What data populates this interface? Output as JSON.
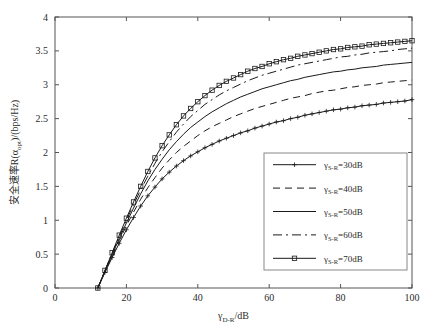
{
  "chart_data": {
    "type": "line",
    "title": "",
    "xlabel": "γD-R/dB",
    "xlabel_main": "γ",
    "xlabel_sub": "D-R",
    "xlabel_unit": "/dB",
    "ylabel": "安全速率R(αopt)/(bps/Hz)",
    "ylabel_part1": "安全速率R(α",
    "ylabel_sub": "opt",
    "ylabel_part2": ")/(bps/Hz)",
    "xlim": [
      0,
      100
    ],
    "ylim": [
      0,
      4
    ],
    "xticks": [
      "0",
      "20",
      "40",
      "60",
      "80",
      "100"
    ],
    "xtick_values": [
      0,
      20,
      40,
      60,
      80,
      100
    ],
    "yticks": [
      "0",
      "0.5",
      "1",
      "1.5",
      "2",
      "2.5",
      "3",
      "3.5",
      "4"
    ],
    "ytick_values": [
      0,
      0.5,
      1,
      1.5,
      2,
      2.5,
      3,
      3.5,
      4
    ],
    "grid": false,
    "legend_position": "lower right",
    "x": [
      12,
      14,
      16,
      18,
      20,
      22,
      24,
      26,
      28,
      30,
      32,
      34,
      36,
      38,
      40,
      42,
      44,
      46,
      48,
      50,
      52,
      54,
      56,
      58,
      60,
      62,
      64,
      66,
      68,
      70,
      72,
      74,
      76,
      78,
      80,
      82,
      84,
      86,
      88,
      90,
      92,
      94,
      96,
      98,
      100
    ],
    "series": [
      {
        "name": "γS-R=30dB",
        "label_main": "γ",
        "label_sub": "S-R",
        "label_rest": "=30dB",
        "style": "solid-plus",
        "marker": "plus",
        "values": [
          0,
          0.23,
          0.45,
          0.66,
          0.86,
          1.04,
          1.21,
          1.36,
          1.49,
          1.61,
          1.71,
          1.8,
          1.88,
          1.95,
          2.01,
          2.07,
          2.12,
          2.17,
          2.21,
          2.25,
          2.29,
          2.32,
          2.36,
          2.39,
          2.42,
          2.45,
          2.47,
          2.5,
          2.52,
          2.55,
          2.57,
          2.59,
          2.61,
          2.63,
          2.64,
          2.66,
          2.67,
          2.69,
          2.7,
          2.71,
          2.73,
          2.74,
          2.75,
          2.76,
          2.78
        ]
      },
      {
        "name": "γS-R=40dB",
        "label_main": "γ",
        "label_sub": "S-R",
        "label_rest": "=40dB",
        "style": "dashed",
        "marker": "none",
        "values": [
          0,
          0.24,
          0.47,
          0.7,
          0.92,
          1.12,
          1.31,
          1.48,
          1.63,
          1.77,
          1.89,
          2.0,
          2.09,
          2.17,
          2.25,
          2.32,
          2.38,
          2.43,
          2.48,
          2.53,
          2.57,
          2.61,
          2.65,
          2.68,
          2.71,
          2.74,
          2.77,
          2.8,
          2.82,
          2.84,
          2.87,
          2.89,
          2.91,
          2.92,
          2.94,
          2.96,
          2.97,
          2.99,
          3.0,
          3.01,
          3.03,
          3.04,
          3.05,
          3.06,
          3.07
        ]
      },
      {
        "name": "γS-R=50dB",
        "label_main": "γ",
        "label_sub": "S-R",
        "label_rest": "=50dB",
        "style": "solid",
        "marker": "none",
        "values": [
          0,
          0.25,
          0.49,
          0.73,
          0.96,
          1.18,
          1.39,
          1.58,
          1.75,
          1.9,
          2.04,
          2.16,
          2.27,
          2.37,
          2.45,
          2.53,
          2.6,
          2.66,
          2.72,
          2.77,
          2.82,
          2.86,
          2.9,
          2.94,
          2.97,
          3.0,
          3.03,
          3.06,
          3.08,
          3.11,
          3.13,
          3.15,
          3.17,
          3.19,
          3.2,
          3.22,
          3.23,
          3.25,
          3.26,
          3.27,
          3.29,
          3.3,
          3.31,
          3.32,
          3.33
        ]
      },
      {
        "name": "γS-R=60dB",
        "label_main": "γ",
        "label_sub": "S-R",
        "label_rest": "=60dB",
        "style": "dashdot",
        "marker": "none",
        "values": [
          0,
          0.26,
          0.51,
          0.76,
          1.0,
          1.23,
          1.45,
          1.65,
          1.84,
          2.01,
          2.16,
          2.3,
          2.42,
          2.53,
          2.62,
          2.71,
          2.78,
          2.85,
          2.91,
          2.96,
          3.01,
          3.06,
          3.1,
          3.14,
          3.17,
          3.2,
          3.23,
          3.26,
          3.29,
          3.31,
          3.33,
          3.35,
          3.37,
          3.39,
          3.41,
          3.42,
          3.44,
          3.45,
          3.47,
          3.48,
          3.49,
          3.5,
          3.52,
          3.53,
          3.54
        ]
      },
      {
        "name": "γS-R=70dB",
        "label_main": "γ",
        "label_sub": "S-R",
        "label_rest": "=70dB",
        "style": "solid-square",
        "marker": "square",
        "values": [
          0,
          0.26,
          0.52,
          0.78,
          1.03,
          1.27,
          1.5,
          1.72,
          1.92,
          2.1,
          2.26,
          2.41,
          2.54,
          2.65,
          2.75,
          2.84,
          2.92,
          2.99,
          3.05,
          3.1,
          3.15,
          3.2,
          3.24,
          3.27,
          3.31,
          3.34,
          3.37,
          3.39,
          3.42,
          3.44,
          3.46,
          3.48,
          3.5,
          3.52,
          3.53,
          3.55,
          3.56,
          3.57,
          3.59,
          3.6,
          3.61,
          3.62,
          3.63,
          3.64,
          3.65
        ]
      }
    ]
  },
  "plot_geometry": {
    "left": 55,
    "right": 412,
    "top": 17,
    "bottom": 288,
    "legend": {
      "x": 264,
      "y": 153,
      "w": 143,
      "h": 117
    }
  },
  "colors": {
    "background": "#ffffff",
    "frame": "#555555",
    "curve": "#1a1a1a",
    "text": "#2b2b2b",
    "legend_border": "#888888"
  }
}
